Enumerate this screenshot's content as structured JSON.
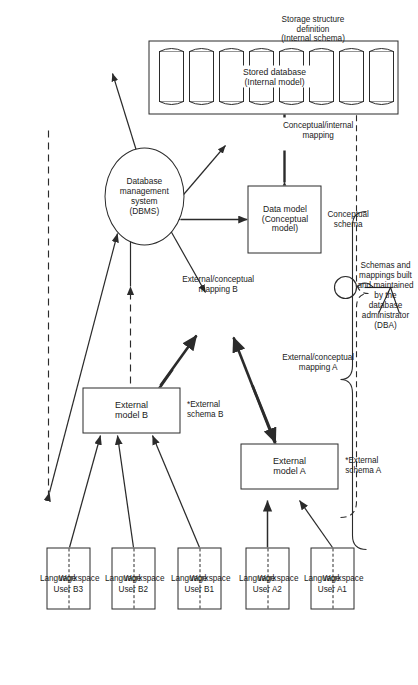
{
  "figure": {
    "orientation": "rotated-90-ccw",
    "colors": {
      "line": "#2b2b2b",
      "text": "#1a1a1a",
      "background": "#ffffff"
    }
  },
  "users": [
    {
      "id": "a1",
      "label": "User A1",
      "top": "Language",
      "bottom": "Workspace"
    },
    {
      "id": "a2",
      "label": "User A2",
      "top": "Language",
      "bottom": "Workspace"
    },
    {
      "id": "b1",
      "label": "User B1",
      "top": "Language",
      "bottom": "Workspace"
    },
    {
      "id": "b2",
      "label": "User B2",
      "top": "Language",
      "bottom": "Workspace"
    },
    {
      "id": "b3",
      "label": "User B3",
      "top": "Language",
      "bottom": "Workspace"
    }
  ],
  "external_models": [
    {
      "id": "a",
      "label": "External model A",
      "schema_caption": "*External\nschema A"
    },
    {
      "id": "b",
      "label": "External model B",
      "schema_caption": "*External\nschema B"
    }
  ],
  "mappings": [
    {
      "id": "ec_a",
      "label": "External/conceptual\nmapping A"
    },
    {
      "id": "ec_b",
      "label": "External/conceptual\nmapping B"
    },
    {
      "id": "ci",
      "label": "Conceptual/internal\nmapping"
    }
  ],
  "conceptual": {
    "box_label": "Data model\n(Conceptual model)",
    "caption": "Conceptual\nschema"
  },
  "dbms": {
    "label": "Database\nmanagement\nsystem\n(DBMS)"
  },
  "storage": {
    "inner_label": "Stored database (Internal model)",
    "caption": "Storage structure\ndefinition\n(Internal schema)",
    "cylinder_count": 8
  },
  "dba": {
    "note": "Schemas and\nmappings built\nand maintained\nby the\ndatabase\nadministrator\n(DBA)",
    "actor_name": "database-administrator"
  }
}
